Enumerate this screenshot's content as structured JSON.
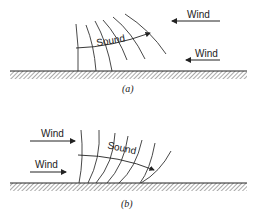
{
  "figure": {
    "panels": [
      {
        "id": "a",
        "caption": "(a)",
        "sound_label": "Sound",
        "wind_labels": [
          "Wind",
          "Wind"
        ],
        "wind_direction": "right-to-left",
        "description": "Wind blowing against sound propagation; wavefronts refract upward"
      },
      {
        "id": "b",
        "caption": "(b)",
        "sound_label": "Sound",
        "wind_labels": [
          "Wind",
          "Wind"
        ],
        "wind_direction": "left-to-right",
        "description": "Wind blowing with sound propagation; wavefronts refract downward toward ground"
      }
    ]
  }
}
